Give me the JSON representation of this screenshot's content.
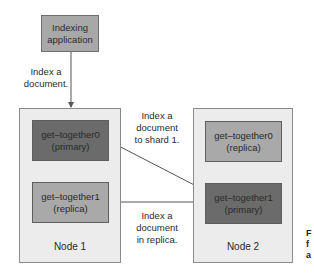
{
  "diagram": {
    "app": {
      "line1": "Indexing",
      "line2": "application"
    },
    "labels": {
      "index_doc": {
        "line1": "Index a",
        "line2": "document."
      },
      "to_shard": {
        "line1": "Index a",
        "line2": "document",
        "line3": "to shard 1."
      },
      "in_replica": {
        "line1": "Index a",
        "line2": "document",
        "line3": "in replica."
      }
    },
    "nodes": [
      {
        "name": "Node 1",
        "shards": [
          {
            "name": "get–together0",
            "role": "(primary)",
            "type": "primary"
          },
          {
            "name": "get–together1",
            "role": "(replica)",
            "type": "replica"
          }
        ]
      },
      {
        "name": "Node 2",
        "shards": [
          {
            "name": "get–together0",
            "role": "(replica)",
            "type": "replica"
          },
          {
            "name": "get–together1",
            "role": "(primary)",
            "type": "primary"
          }
        ]
      }
    ],
    "caption_fragment": {
      "line1": "F",
      "line2": "f",
      "line3": "a"
    },
    "colors": {
      "primary_fill": "#6b6b6b",
      "replica_fill": "#a9a9a9",
      "node_fill": "#ececec",
      "app_fill": "#a8a8a8",
      "line": "#555555"
    }
  }
}
